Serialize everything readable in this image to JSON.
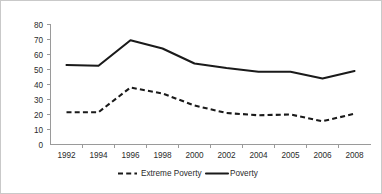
{
  "chart_data": {
    "type": "line",
    "title": "",
    "xlabel": "",
    "ylabel": "",
    "ylim": [
      0,
      80
    ],
    "ytick_step": 10,
    "grid": false,
    "legend_position": "bottom",
    "categories": [
      "1992",
      "1994",
      "1996",
      "1998",
      "2000",
      "2002",
      "2004",
      "2005",
      "2006",
      "2008"
    ],
    "yticks": [
      "0",
      "10",
      "20",
      "30",
      "40",
      "50",
      "60",
      "70",
      "80"
    ],
    "series": [
      {
        "name": "Extreme Poverty",
        "style": "dashed",
        "color": "#1a1a1a",
        "values": [
          21.5,
          21.5,
          38,
          34,
          26,
          21,
          19.5,
          20,
          15.5,
          20.5
        ]
      },
      {
        "name": "Poverty",
        "style": "solid",
        "color": "#1a1a1a",
        "values": [
          53,
          52.5,
          69.5,
          64,
          54,
          51,
          48.5,
          48.5,
          44,
          49
        ]
      }
    ]
  },
  "legend": {
    "items": [
      {
        "label": "Extreme Poverty",
        "style": "dashed"
      },
      {
        "label": "Poverty",
        "style": "solid"
      }
    ]
  }
}
